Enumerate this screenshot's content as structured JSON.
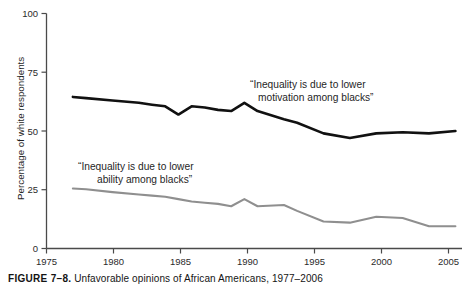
{
  "caption": {
    "label": "FIGURE 7–8.",
    "text": "Unfavorable opinions of African Americans, 1977–2006"
  },
  "axis": {
    "ylabel": "Percentage of white respondents",
    "xlabel": "",
    "yticks": [
      "0",
      "25",
      "50",
      "75",
      "100"
    ],
    "xticks": [
      "1975",
      "1980",
      "1985",
      "1990",
      "1995",
      "2000",
      "2005"
    ]
  },
  "colors": {
    "motivation_line": "#111111",
    "ability_line": "#8f8f8f",
    "axis": "#4a4a4a",
    "text": "#1f1f1f",
    "background": "#ffffff"
  },
  "annotations": [
    {
      "name": "motivation-label",
      "line1": "“Inequality is due to lower",
      "line2": "motivation among blacks”",
      "x": 250,
      "y": 88
    },
    {
      "name": "ability-label",
      "line1": "“Inequality is due to lower",
      "line2": "ability among blacks”",
      "x": 78,
      "y": 170
    }
  ],
  "chart_data": {
    "type": "line",
    "title": "Unfavorable opinions of African Americans, 1977–2006",
    "xlabel": "",
    "ylabel": "Percentage of white respondents",
    "xlim": [
      1975,
      2006.5
    ],
    "ylim": [
      0,
      100
    ],
    "grid": false,
    "legend": "inline-annotations",
    "x": [
      1977,
      1978,
      1980,
      1982,
      1983,
      1984,
      1985,
      1986,
      1987,
      1988,
      1989,
      1990,
      1991,
      1993,
      1994,
      1996,
      1998,
      2000,
      2002,
      2004,
      2006
    ],
    "series": [
      {
        "name": "“Inequality is due to lower motivation among blacks”",
        "color": "#111111",
        "values": [
          64.5,
          64.0,
          63.0,
          62.0,
          61.2,
          60.5,
          57.0,
          60.5,
          60.0,
          59.0,
          58.5,
          62.0,
          58.5,
          55.0,
          53.5,
          49.0,
          47.0,
          49.0,
          49.5,
          49.0,
          50.0
        ]
      },
      {
        "name": "“Inequality is due to lower ability among blacks”",
        "color": "#8f8f8f",
        "values": [
          25.5,
          25.2,
          24.0,
          23.0,
          22.5,
          22.0,
          21.0,
          20.0,
          19.5,
          19.0,
          18.0,
          21.0,
          18.0,
          18.5,
          16.0,
          11.5,
          11.0,
          13.5,
          13.0,
          9.5,
          9.5
        ]
      }
    ]
  }
}
